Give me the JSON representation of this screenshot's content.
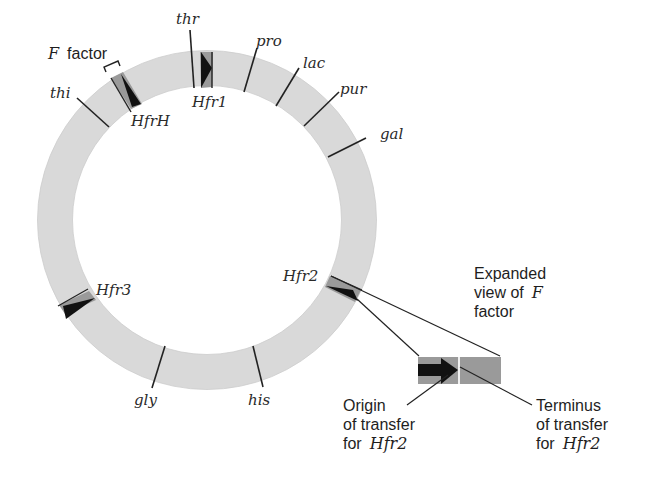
{
  "diagram": {
    "type": "circular chromosome map (E. coli) with Hfr integration sites",
    "colors": {
      "ring": "#d9d9d9",
      "ring_edge": "#c4c4c4",
      "f_factor_box": "#9a9a9a",
      "arrow": "#111111",
      "line": "#222222"
    },
    "f_factor_label": {
      "italic": "F",
      "text": "factor"
    },
    "genes": [
      {
        "label": "thr"
      },
      {
        "label": "pro"
      },
      {
        "label": "lac"
      },
      {
        "label": "pur"
      },
      {
        "label": "gal"
      },
      {
        "label": "his"
      },
      {
        "label": "gly"
      },
      {
        "label": "thi"
      }
    ],
    "hfr_sites": [
      {
        "label": "Hfr1"
      },
      {
        "label": "HfrH"
      },
      {
        "label": "Hfr2"
      },
      {
        "label": "Hfr3"
      }
    ],
    "expanded_view": {
      "line1": "Expanded",
      "line2": "view of",
      "line2_italic": "F",
      "line3": "factor"
    },
    "origin_label": {
      "line1": "Origin",
      "line2": "of transfer",
      "line3": "for",
      "line3_italic": "Hfr2"
    },
    "terminus_label": {
      "line1": "Terminus",
      "line2": "of transfer",
      "line3": "for",
      "line3_italic": "Hfr2"
    }
  }
}
